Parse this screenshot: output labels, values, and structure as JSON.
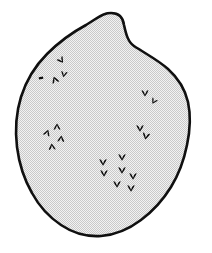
{
  "figure": {
    "type": "line-illustration",
    "caption": "",
    "width": 212,
    "height": 253
  },
  "colors": {
    "background": "#ffffff",
    "outline": "#101010",
    "fill_halftone": "#e2e2e2",
    "fill_dot": "#c9c9c9",
    "mark": "#0d0d0d"
  },
  "cell": {
    "name": "cell-body",
    "shape": "ovoid-with-apical-nub",
    "outline_stroke_width": 2.6,
    "has_top_protrusion": true,
    "outline_path": "M 111 13 C 118 13 123 17 124 25 C 126 34 128 42 134 46 C 146 54 158 60 168 69 C 178 78 185 89 188 102 C 191 116 190 131 187 145 C 184 160 179 174 171 187 C 163 200 153 211 141 220 C 129 229 115 235 101 236 C 87 237 73 233 61 225 C 49 217 39 206 32 193 C 24 179 19 163 17 147 C 15 130 16 113 21 97 C 26 81 35 66 47 54 C 59 42 73 32 86 25 C 94 20 101 15 105 14 C 107 13 109 13 111 13 Z",
    "nub_path": "M 97 46 C 99 36 101 27 106 21 C 110 16 117 15 121 20 C 126 26 127 35 129 45"
  },
  "clusters": [
    {
      "name": "cluster-upper-left",
      "label": "upper-left chromosome group",
      "count": 4,
      "marks": [
        {
          "cx": 61,
          "cy": 60,
          "r": 3.0,
          "rot": -35,
          "kind": "chevron"
        },
        {
          "cx": 64,
          "cy": 74,
          "r": 2.8,
          "rot": 10,
          "kind": "chevron"
        },
        {
          "cx": 41,
          "cy": 78,
          "r": 2.4,
          "rot": 80,
          "kind": "bar"
        },
        {
          "cx": 55,
          "cy": 80,
          "r": 3.1,
          "rot": 160,
          "kind": "chevron"
        }
      ]
    },
    {
      "name": "cluster-right-upper",
      "label": "right upper chromosome group",
      "count": 2,
      "marks": [
        {
          "cx": 145,
          "cy": 93,
          "r": 3.0,
          "rot": 0,
          "kind": "chevron"
        },
        {
          "cx": 154,
          "cy": 101,
          "r": 2.7,
          "rot": 30,
          "kind": "chevron"
        }
      ]
    },
    {
      "name": "cluster-left-middle",
      "label": "left middle chromosome group",
      "count": 4,
      "marks": [
        {
          "cx": 57,
          "cy": 127,
          "r": 3.0,
          "rot": 180,
          "kind": "chevron"
        },
        {
          "cx": 47,
          "cy": 133,
          "r": 3.0,
          "rot": 200,
          "kind": "chevron"
        },
        {
          "cx": 61,
          "cy": 139,
          "r": 3.0,
          "rot": 185,
          "kind": "chevron"
        },
        {
          "cx": 52,
          "cy": 147,
          "r": 3.0,
          "rot": 175,
          "kind": "chevron"
        }
      ]
    },
    {
      "name": "cluster-right-middle",
      "label": "right middle chromosome group",
      "count": 2,
      "marks": [
        {
          "cx": 140,
          "cy": 128,
          "r": 3.2,
          "rot": 0,
          "kind": "chevron"
        },
        {
          "cx": 146,
          "cy": 136,
          "r": 3.2,
          "rot": 10,
          "kind": "chevron"
        }
      ]
    },
    {
      "name": "cluster-bottom-center",
      "label": "bottom center chromosome group",
      "count": 7,
      "marks": [
        {
          "cx": 122,
          "cy": 157,
          "r": 3.2,
          "rot": 0,
          "kind": "chevron"
        },
        {
          "cx": 103,
          "cy": 162,
          "r": 3.2,
          "rot": 0,
          "kind": "chevron"
        },
        {
          "cx": 104,
          "cy": 173,
          "r": 3.2,
          "rot": 0,
          "kind": "chevron"
        },
        {
          "cx": 122,
          "cy": 170,
          "r": 3.2,
          "rot": 0,
          "kind": "chevron"
        },
        {
          "cx": 133,
          "cy": 176,
          "r": 3.2,
          "rot": 0,
          "kind": "chevron"
        },
        {
          "cx": 117,
          "cy": 184,
          "r": 3.2,
          "rot": 0,
          "kind": "chevron"
        },
        {
          "cx": 131,
          "cy": 188,
          "r": 3.2,
          "rot": 0,
          "kind": "chevron"
        }
      ]
    }
  ]
}
